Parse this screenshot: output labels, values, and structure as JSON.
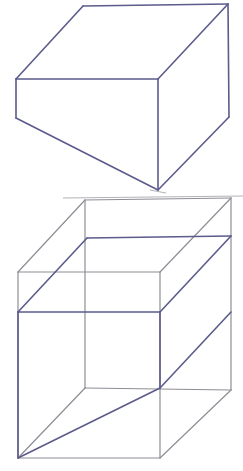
{
  "page": {
    "background_color": "#ffffff",
    "width": 243,
    "height": 471
  },
  "styles": {
    "wedge_stroke_color": "#5b5b8c",
    "cube_stroke_color": "#8d8d95",
    "artifact_stroke_color": "#a9a9b0",
    "wedge_stroke_width": 1.6,
    "cube_stroke_width": 1.2,
    "artifact_stroke_width": 0.9
  },
  "figures": [
    {
      "id": "figure-top-wedge",
      "name": "wedge-prism-standalone",
      "label": "Wedge (triangular prism) drawn alone",
      "vertices": {
        "top_back_left": [
          83,
          6
        ],
        "top_back_right": [
          228,
          4
        ],
        "top_front_left": [
          16,
          79
        ],
        "top_front_right": [
          158,
          79
        ],
        "bottom_front_left": [
          16,
          118
        ],
        "bottom_front_right": [
          158,
          190
        ],
        "bottom_back_right": [
          229,
          117
        ]
      },
      "edges": [
        {
          "name": "top-face-back-edge",
          "from": "top_back_left",
          "to": "top_back_right"
        },
        {
          "name": "top-face-left-slant",
          "from": "top_back_left",
          "to": "top_front_left"
        },
        {
          "name": "top-face-front-edge",
          "from": "top_front_left",
          "to": "top_front_right"
        },
        {
          "name": "top-face-right-slant",
          "from": "top_front_right",
          "to": "top_back_right"
        },
        {
          "name": "left-vertical-edge",
          "from": "top_front_left",
          "to": "bottom_front_left"
        },
        {
          "name": "front-face-lower-slant",
          "from": "bottom_front_left",
          "to": "bottom_front_right"
        },
        {
          "name": "middle-vertical-edge",
          "from": "top_front_right",
          "to": "bottom_front_right"
        },
        {
          "name": "right-lower-slant",
          "from": "bottom_front_right",
          "to": "bottom_back_right"
        },
        {
          "name": "right-vertical-edge",
          "from": "bottom_back_right",
          "to": "top_back_right"
        }
      ]
    },
    {
      "id": "figure-bottom-cube-with-wedge",
      "name": "wedge-inscribed-in-cube",
      "label": "Same wedge shown inscribed inside a cube",
      "cube_vertices": {
        "back_top_left": [
          85,
          200
        ],
        "back_top_right": [
          231,
          198
        ],
        "front_top_left": [
          18,
          272
        ],
        "front_top_right": [
          160,
          272
        ],
        "back_bottom_right": [
          231,
          390
        ],
        "front_bottom_left": [
          18,
          458
        ],
        "front_bottom_right": [
          160,
          458
        ],
        "back_bottom_left": [
          85,
          388
        ]
      },
      "cube_edges": [
        {
          "name": "cube-back-top-edge",
          "from": "back_top_left",
          "to": "back_top_right"
        },
        {
          "name": "cube-top-left-slant",
          "from": "back_top_left",
          "to": "front_top_left"
        },
        {
          "name": "cube-front-top-edge",
          "from": "front_top_left",
          "to": "front_top_right"
        },
        {
          "name": "cube-top-right-slant",
          "from": "front_top_right",
          "to": "back_top_right"
        },
        {
          "name": "cube-front-left-vertical",
          "from": "front_top_left",
          "to": "front_bottom_left"
        },
        {
          "name": "cube-front-right-vertical",
          "from": "front_top_right",
          "to": "front_bottom_right"
        },
        {
          "name": "cube-back-right-vertical",
          "from": "back_top_right",
          "to": "back_bottom_right"
        },
        {
          "name": "cube-back-left-vertical",
          "from": "back_top_left",
          "to": "back_bottom_left"
        },
        {
          "name": "cube-front-bottom-edge",
          "from": "front_bottom_left",
          "to": "front_bottom_right"
        },
        {
          "name": "cube-bottom-left-slant",
          "from": "front_bottom_left",
          "to": "back_bottom_left"
        },
        {
          "name": "cube-bottom-right-slant",
          "from": "front_bottom_right",
          "to": "back_bottom_right"
        },
        {
          "name": "cube-back-bottom-edge",
          "from": "back_bottom_left",
          "to": "back_bottom_right"
        }
      ],
      "wedge_vertices": {
        "apex_back_left": [
          87,
          238
        ],
        "apex_back_right": [
          231,
          236
        ],
        "ridge_front_left": [
          18,
          312
        ],
        "ridge_front_right": [
          160,
          312
        ],
        "base_front_left": [
          18,
          458
        ],
        "base_front_right": [
          160,
          388
        ],
        "base_back_right": [
          231,
          312
        ]
      },
      "wedge_edges": [
        {
          "name": "wedge-top-back-edge",
          "from": "apex_back_left",
          "to": "apex_back_right"
        },
        {
          "name": "wedge-top-left-slant",
          "from": "apex_back_left",
          "to": "ridge_front_left"
        },
        {
          "name": "wedge-ridge-front-edge",
          "from": "ridge_front_left",
          "to": "ridge_front_right"
        },
        {
          "name": "wedge-top-right-slant",
          "from": "ridge_front_right",
          "to": "apex_back_right"
        },
        {
          "name": "wedge-left-vertical",
          "from": "ridge_front_left",
          "to": "base_front_left"
        },
        {
          "name": "wedge-front-lower-slant",
          "from": "base_front_left",
          "to": "base_front_right"
        },
        {
          "name": "wedge-middle-vertical",
          "from": "ridge_front_right",
          "to": "base_front_right"
        },
        {
          "name": "wedge-right-lower-slant",
          "from": "base_front_right",
          "to": "base_back_right"
        }
      ]
    }
  ],
  "artifacts": [
    {
      "name": "scan-line-under-top-figure",
      "from": [
        63,
        198
      ],
      "to": [
        243,
        196
      ]
    },
    {
      "name": "scan-mark-top-of-cube",
      "from": [
        150,
        190
      ],
      "to": [
        166,
        193
      ]
    }
  ]
}
